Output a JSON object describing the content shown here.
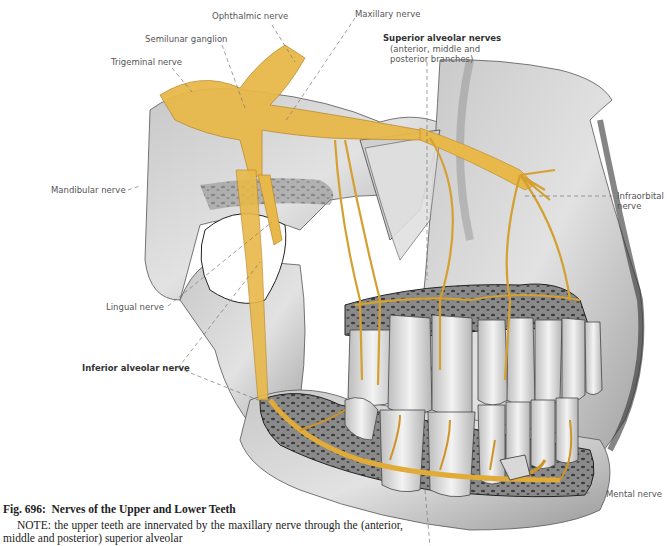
{
  "figure": {
    "number": "Fig. 696:",
    "title": "Nerves of the Upper and Lower Teeth",
    "colors": {
      "nerve": "#e8b94a",
      "nerve_dark": "#c98f1e",
      "bone_light": "#d9d9d9",
      "bone_mid": "#a8a8a8",
      "bone_dark": "#5a5a5a",
      "tooth": "#ececec",
      "label_text": "#555555",
      "leader_line": "#777777"
    },
    "labels": {
      "ophthalmic": "Ophthalmic nerve",
      "maxillary": "Maxillary nerve",
      "semilunar": "Semilunar ganglion",
      "trigeminal": "Trigeminal nerve",
      "superior_alveolar_title": "Superior alveolar nerves",
      "superior_alveolar_sub1": "(anterior, middle and",
      "superior_alveolar_sub2": "posterior branches)",
      "mandibular": "Mandibular nerve",
      "infraorbital1": "Infraorbital",
      "infraorbital2": "nerve",
      "lingual": "Lingual nerve",
      "inferior_alveolar": "Inferior alveolar nerve",
      "mental": "Mental nerve"
    }
  },
  "caption": {
    "note": "NOTE: the upper teeth are innervated by the maxillary nerve through the (anterior, middle and posterior) superior alveolar"
  }
}
